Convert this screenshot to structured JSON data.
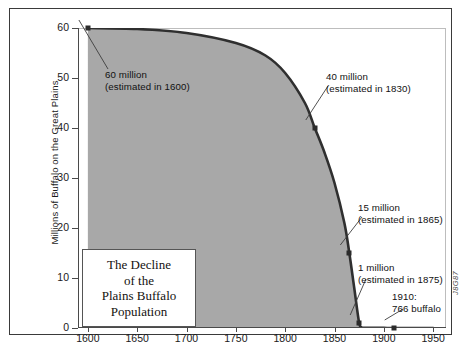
{
  "figure": {
    "credit": "J8G87",
    "caption": "",
    "title_card": {
      "line1": "The Decline",
      "line2": "of the",
      "line3": "Plains Buffalo",
      "line4": "Population"
    },
    "colors": {
      "area_fill": "#a8a8a8",
      "curve": "#2f2f2f",
      "frame": "#3a3a3a",
      "text": "#111111"
    }
  },
  "chart_data": {
    "type": "area",
    "title": "The Decline of the Plains Buffalo Population",
    "xlabel": "",
    "ylabel": "Millions of Buffalo on the Great Plains",
    "xlim": [
      1590,
      1963
    ],
    "ylim": [
      0,
      60
    ],
    "grid": false,
    "legend": null,
    "xticks": [
      1600,
      1650,
      1700,
      1750,
      1800,
      1850,
      1900,
      1950
    ],
    "xtick_labels": [
      "1600",
      "1650",
      "1700",
      "1750",
      "1800",
      "1850",
      "1900",
      "1950"
    ],
    "yticks": [
      0,
      10,
      20,
      30,
      40,
      50,
      60
    ],
    "ytick_labels": [
      "0",
      "10",
      "20",
      "30",
      "40",
      "50",
      "60"
    ],
    "x": [
      1600,
      1650,
      1700,
      1750,
      1780,
      1800,
      1820,
      1830,
      1840,
      1850,
      1860,
      1865,
      1870,
      1875,
      1878,
      1880,
      1900,
      1910,
      1950
    ],
    "y": [
      60,
      59.8,
      59,
      57,
      54.5,
      51,
      45,
      40,
      35,
      29,
      21,
      15,
      8,
      1,
      0.1,
      0.05,
      0.02,
      0.0008,
      0.0008
    ],
    "annotations": [
      {
        "label_line1": "60 million",
        "label_line2": "(estimated in 1600)",
        "point_x": 1600,
        "point_y": 60,
        "value": 60,
        "year": 1600
      },
      {
        "label_line1": "40 million",
        "label_line2": "(estimated in 1830)",
        "point_x": 1830,
        "point_y": 40,
        "value": 40,
        "year": 1830
      },
      {
        "label_line1": "15 million",
        "label_line2": "(estimated in 1865)",
        "point_x": 1865,
        "point_y": 15,
        "value": 15,
        "year": 1865
      },
      {
        "label_line1": "1 million",
        "label_line2": "(estimated in 1875)",
        "point_x": 1875,
        "point_y": 1,
        "value": 1,
        "year": 1875
      },
      {
        "label_line1": "1910:",
        "label_line2": "766 buffalo",
        "point_x": 1910,
        "point_y": 0.0008,
        "value": 0.000766,
        "year": 1910
      }
    ]
  }
}
